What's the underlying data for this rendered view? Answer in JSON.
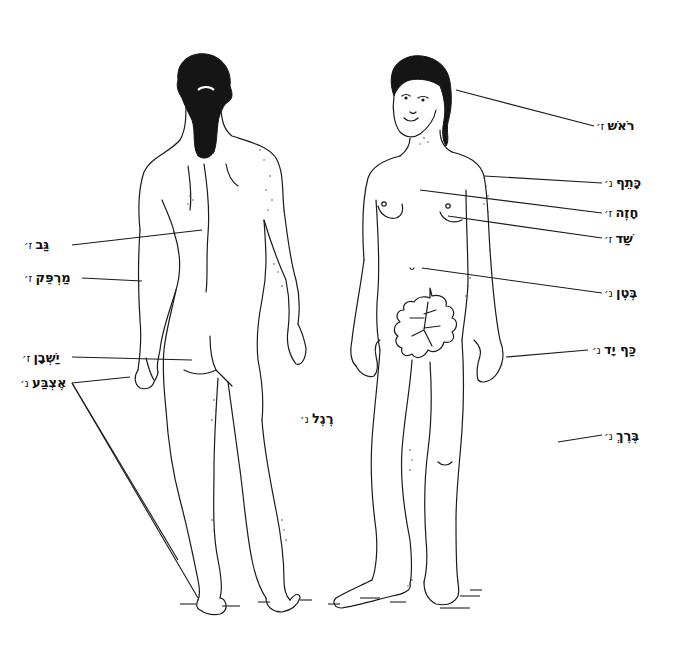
{
  "diagram": {
    "title": "",
    "figures": [
      {
        "id": "back-view",
        "description": "woman seen from behind with ponytail"
      },
      {
        "id": "front-view",
        "description": "woman seen from front with fig leaf"
      }
    ],
    "labels_right": [
      {
        "word": "רֹאשׁ",
        "gender": "ז׳",
        "meaning": "head"
      },
      {
        "word": "כָּתֵף",
        "gender": "נ׳",
        "meaning": "shoulder"
      },
      {
        "word": "חָזֶה",
        "gender": "ז׳",
        "meaning": "chest"
      },
      {
        "word": "שַׁד",
        "gender": "ז׳",
        "meaning": "breast"
      },
      {
        "word": "בֶּטֶן",
        "gender": "נ׳",
        "meaning": "belly"
      },
      {
        "word": "כַּף יָד",
        "gender": "נ׳",
        "meaning": "palm of hand"
      },
      {
        "word": "בֶּרֶךְ",
        "gender": "נ׳",
        "meaning": "knee"
      }
    ],
    "labels_left": [
      {
        "word": "גַּב",
        "gender": "ז׳",
        "meaning": "back"
      },
      {
        "word": "מַרְפֵּק",
        "gender": "ז׳",
        "meaning": "elbow"
      },
      {
        "word": "יַשְׁבָן",
        "gender": "ז׳",
        "meaning": "buttocks"
      },
      {
        "word": "אֶצְבַּע",
        "gender": "נ׳",
        "meaning": "finger / toe"
      }
    ],
    "labels_center": [
      {
        "word": "רֶגֶל",
        "gender": "נ׳",
        "meaning": "leg / foot"
      }
    ],
    "colors": {
      "ink": "#1a1a1a",
      "paper": "#ffffff"
    }
  }
}
